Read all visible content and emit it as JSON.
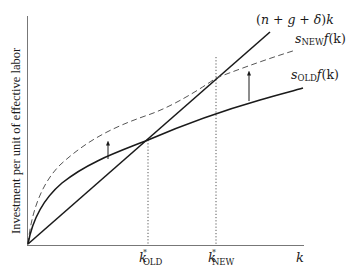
{
  "diagram": {
    "y_axis_label": "Investment per unit of effective labor",
    "x_axis_label": "k",
    "curves": {
      "break_even": {
        "label_pre": "(",
        "label_n": "n",
        "label_plus1": " + ",
        "label_g": "g",
        "label_plus2": " + ",
        "label_delta": "δ",
        "label_close": ")",
        "label_k": "k",
        "style": "solid"
      },
      "s_new": {
        "label_s": "s",
        "label_sub": "NEW",
        "label_f": "f",
        "label_arg": "(k)",
        "style": "dashed"
      },
      "s_old": {
        "label_s": "s",
        "label_sub": "OLD",
        "label_f": "f",
        "label_arg": "(k)",
        "style": "solid"
      }
    },
    "x_ticks": {
      "k_old": {
        "k": "k",
        "star": "*",
        "sub": "OLD"
      },
      "k_new": {
        "k": "k",
        "star": "*",
        "sub": "NEW"
      }
    },
    "arrows": [
      {
        "name": "shift-arrow-left",
        "direction": "up"
      },
      {
        "name": "shift-arrow-right",
        "direction": "up"
      }
    ],
    "colors": {
      "ink": "#1a1a1a",
      "dashed": "#555555",
      "dotted": "#444444"
    }
  }
}
